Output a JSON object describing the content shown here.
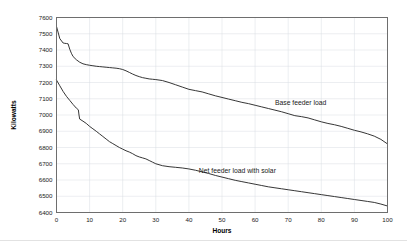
{
  "chart_data": {
    "type": "line",
    "title": "",
    "xlabel": "Hours",
    "ylabel": "Kilowatts",
    "xlim": [
      0,
      100
    ],
    "ylim": [
      6400,
      7600
    ],
    "xticks": [
      0,
      10,
      20,
      30,
      40,
      50,
      60,
      70,
      80,
      90,
      100
    ],
    "ytick_labels": [
      "7600",
      "7500",
      "7400",
      "7300",
      "7200",
      "7100",
      "7000",
      "6900",
      "6800",
      "6700",
      "6600",
      "6500",
      "6400"
    ],
    "yticks": [
      7600,
      7500,
      7400,
      7300,
      7200,
      7100,
      7000,
      6900,
      6800,
      6700,
      6600,
      6500,
      6400
    ],
    "grid": true,
    "legend_position": "inline-annotations",
    "line_color": "#2b2b2b",
    "grid_color": "#d9dde3",
    "border_color": "#6e6e6e",
    "series": [
      {
        "name": "Base feeder load",
        "label_x": 66,
        "label_y": 7060,
        "x": [
          0,
          1,
          2,
          2.5,
          3,
          3.5,
          4,
          4.5,
          5,
          6,
          7,
          8,
          9,
          10,
          11,
          12,
          13,
          14,
          15,
          16,
          17,
          18,
          19,
          20,
          21,
          22,
          23,
          24,
          25,
          26,
          27,
          28,
          29,
          30,
          32,
          34,
          36,
          38,
          40,
          42,
          44,
          46,
          48,
          50,
          52,
          54,
          56,
          58,
          60,
          62,
          64,
          66,
          68,
          70,
          72,
          74,
          76,
          78,
          80,
          82,
          84,
          86,
          88,
          90,
          92,
          94,
          96,
          98,
          100
        ],
        "y": [
          7545,
          7470,
          7443,
          7441,
          7440,
          7438,
          7405,
          7380,
          7360,
          7340,
          7325,
          7315,
          7310,
          7306,
          7303,
          7300,
          7298,
          7296,
          7294,
          7292,
          7290,
          7288,
          7285,
          7280,
          7272,
          7262,
          7252,
          7243,
          7236,
          7230,
          7226,
          7222,
          7220,
          7218,
          7212,
          7200,
          7186,
          7172,
          7158,
          7150,
          7142,
          7130,
          7118,
          7108,
          7098,
          7088,
          7078,
          7070,
          7060,
          7050,
          7040,
          7030,
          7020,
          7008,
          6996,
          6990,
          6982,
          6970,
          6958,
          6948,
          6940,
          6930,
          6918,
          6906,
          6896,
          6884,
          6870,
          6850,
          6822
        ]
      },
      {
        "name": "Net feeder load with solar",
        "label_x": 43,
        "label_y": 6645,
        "x": [
          0,
          1,
          2,
          3,
          4,
          5,
          6,
          6.6,
          6.8,
          7,
          8,
          9,
          10,
          11,
          12,
          13,
          14,
          15,
          16,
          17,
          18,
          19,
          20,
          21,
          22,
          23,
          24,
          25,
          26,
          27,
          28,
          29,
          30,
          32,
          34,
          36,
          38,
          40,
          42,
          44,
          46,
          48,
          50,
          52,
          54,
          56,
          58,
          60,
          62,
          64,
          66,
          68,
          70,
          72,
          74,
          76,
          78,
          80,
          82,
          84,
          86,
          88,
          90,
          92,
          94,
          96,
          98,
          100
        ],
        "y": [
          7215,
          7180,
          7145,
          7115,
          7090,
          7065,
          7042,
          7032,
          7000,
          6975,
          6962,
          6948,
          6930,
          6915,
          6900,
          6884,
          6868,
          6852,
          6836,
          6824,
          6812,
          6800,
          6790,
          6780,
          6772,
          6762,
          6750,
          6742,
          6736,
          6730,
          6720,
          6710,
          6700,
          6688,
          6682,
          6678,
          6674,
          6668,
          6660,
          6650,
          6640,
          6628,
          6618,
          6608,
          6598,
          6590,
          6582,
          6574,
          6566,
          6558,
          6552,
          6546,
          6540,
          6534,
          6528,
          6522,
          6516,
          6510,
          6504,
          6498,
          6492,
          6486,
          6480,
          6474,
          6468,
          6462,
          6452,
          6440
        ]
      }
    ]
  }
}
